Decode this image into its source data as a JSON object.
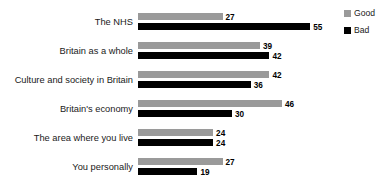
{
  "chart_data": {
    "type": "bar",
    "orientation": "horizontal",
    "title": "",
    "xlabel": "",
    "ylabel": "",
    "grid": false,
    "legend_position": "right-top",
    "xlim": [
      0,
      55
    ],
    "categories": [
      "The NHS",
      "Britain as a whole",
      "Culture and society in Britain",
      "Britain's economy",
      "The area where you live",
      "You personally"
    ],
    "series": [
      {
        "name": "Good",
        "color": "#9a9a9a",
        "values": [
          27,
          39,
          42,
          46,
          24,
          27
        ]
      },
      {
        "name": "Bad",
        "color": "#000000",
        "values": [
          55,
          42,
          36,
          30,
          24,
          19
        ]
      }
    ]
  },
  "legend": {
    "items": [
      {
        "label": "Good",
        "swatch": "good-swatch"
      },
      {
        "label": "Bad",
        "swatch": "bad-swatch"
      }
    ]
  },
  "colors": {
    "good": "#9a9a9a",
    "bad": "#000000",
    "background": "#ffffff",
    "text": "#1a1a1a"
  }
}
